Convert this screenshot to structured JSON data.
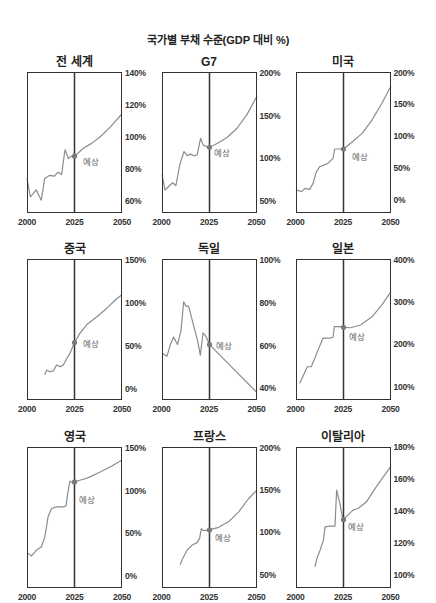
{
  "page": {
    "title": "국가별 부채 수준(GDP 대비 %)"
  },
  "chart_data": {
    "type": "line",
    "title": "국가별 부채 수준(GDP 대비 %)",
    "layout": "small-multiples 3x3 (third row cropped)",
    "colors": {
      "line": "#8c8c8c",
      "dot": "#7a7a7a",
      "frame": "#333333",
      "label": "#666666"
    },
    "forecast_start": 2025,
    "panels": [
      {
        "title": "전 세계",
        "xlim": [
          2000,
          2050
        ],
        "ylim": [
          52.5,
          140.6
        ],
        "xticks": [
          {
            "value": 2000,
            "label": "2000"
          },
          {
            "value": 2025,
            "label": "2025"
          },
          {
            "value": 2050,
            "label": "2050"
          }
        ],
        "yticks": [
          {
            "value": 140,
            "label": "140%"
          },
          {
            "value": 120,
            "label": "120%"
          },
          {
            "value": 100,
            "label": "100%"
          },
          {
            "value": 80,
            "label": "80%"
          },
          {
            "value": 60,
            "label": "60%"
          }
        ],
        "history": [
          [
            2000,
            74
          ],
          [
            2001.8,
            62.5
          ],
          [
            2004.8,
            67
          ],
          [
            2007.5,
            60.5
          ],
          [
            2009.3,
            74
          ],
          [
            2011.8,
            76
          ],
          [
            2014.5,
            75.5
          ],
          [
            2016.3,
            78
          ],
          [
            2018.2,
            76.5
          ],
          [
            2020,
            92
          ],
          [
            2021.8,
            86.5
          ],
          [
            2023.2,
            88
          ],
          [
            2025,
            88
          ]
        ],
        "forecast": [
          [
            2025,
            88
          ],
          [
            2029.7,
            93
          ],
          [
            2034,
            96
          ],
          [
            2038.4,
            100
          ],
          [
            2043.7,
            106
          ],
          [
            2050,
            114.5
          ]
        ],
        "forecast_label": {
          "text": "예상",
          "dx": 8,
          "dy": 6
        }
      },
      {
        "title": "G7",
        "xlim": [
          2000,
          2050
        ],
        "ylim": [
          36,
          201.2
        ],
        "xticks": [
          {
            "value": 2000,
            "label": "2000"
          },
          {
            "value": 2025,
            "label": "2025"
          },
          {
            "value": 2050,
            "label": "2050"
          }
        ],
        "yticks": [
          {
            "value": 200,
            "label": "200%"
          },
          {
            "value": 150,
            "label": "150%"
          },
          {
            "value": 100,
            "label": "100%"
          },
          {
            "value": 50,
            "label": "50%"
          }
        ],
        "history": [
          [
            2000,
            81
          ],
          [
            2001.6,
            63
          ],
          [
            2003.5,
            67
          ],
          [
            2005.6,
            71.5
          ],
          [
            2007.3,
            68
          ],
          [
            2009.5,
            94
          ],
          [
            2011.6,
            108
          ],
          [
            2013.4,
            103
          ],
          [
            2015,
            105
          ],
          [
            2016.8,
            103
          ],
          [
            2018.5,
            104
          ],
          [
            2020.3,
            123.5
          ],
          [
            2021.7,
            115.5
          ],
          [
            2023.3,
            114
          ],
          [
            2025,
            113
          ]
        ],
        "forecast": [
          [
            2025,
            113
          ],
          [
            2029,
            117.5
          ],
          [
            2034.2,
            124.5
          ],
          [
            2039.4,
            135
          ],
          [
            2044.6,
            151
          ],
          [
            2050,
            173
          ]
        ],
        "forecast_label": {
          "text": "예상",
          "dx": 5,
          "dy": 6
        }
      },
      {
        "title": "미국",
        "xlim": [
          2000,
          2050
        ],
        "ylim": [
          -20.6,
          201
        ],
        "xticks": [
          {
            "value": 2000,
            "label": "2000"
          },
          {
            "value": 2025,
            "label": "2025"
          },
          {
            "value": 2050,
            "label": "2050"
          }
        ],
        "yticks": [
          {
            "value": 200,
            "label": "200%"
          },
          {
            "value": 150,
            "label": "150%"
          },
          {
            "value": 100,
            "label": "100%"
          },
          {
            "value": 50,
            "label": "50%"
          },
          {
            "value": 0,
            "label": "0%"
          }
        ],
        "history": [
          [
            2000,
            15.5
          ],
          [
            2003,
            13
          ],
          [
            2004.7,
            18
          ],
          [
            2007.2,
            16.5
          ],
          [
            2009,
            26
          ],
          [
            2010.7,
            44
          ],
          [
            2012.4,
            52
          ],
          [
            2015,
            55
          ],
          [
            2016.8,
            57.5
          ],
          [
            2018.5,
            62.5
          ],
          [
            2019.5,
            65
          ],
          [
            2020.3,
            80
          ],
          [
            2022,
            80
          ],
          [
            2025,
            80
          ]
        ],
        "forecast": [
          [
            2025,
            80
          ],
          [
            2029.7,
            91.5
          ],
          [
            2034.8,
            104.5
          ],
          [
            2040,
            125.5
          ],
          [
            2045.2,
            152
          ],
          [
            2050,
            179
          ]
        ],
        "forecast_label": {
          "text": "예상",
          "dx": 8.5,
          "dy": 8
        }
      },
      {
        "title": "중국",
        "xlim": [
          2000,
          2050
        ],
        "ylim": [
          -12.8,
          151.2
        ],
        "xticks": [
          {
            "value": 2000,
            "label": "2000"
          },
          {
            "value": 2025,
            "label": "2025"
          },
          {
            "value": 2050,
            "label": "2050"
          }
        ],
        "yticks": [
          {
            "value": 150,
            "label": "150%"
          },
          {
            "value": 100,
            "label": "100%"
          },
          {
            "value": 50,
            "label": "50%"
          },
          {
            "value": 0,
            "label": "0%"
          }
        ],
        "history": [
          [
            2009.4,
            16.5
          ],
          [
            2010.3,
            22
          ],
          [
            2012,
            20
          ],
          [
            2013.8,
            21
          ],
          [
            2015.6,
            28
          ],
          [
            2017.5,
            26
          ],
          [
            2019.1,
            28
          ],
          [
            2020.9,
            35.5
          ],
          [
            2022.6,
            41.5
          ],
          [
            2025,
            54
          ]
        ],
        "forecast": [
          [
            2025,
            54
          ],
          [
            2027.9,
            65
          ],
          [
            2031.5,
            75
          ],
          [
            2036.8,
            84
          ],
          [
            2042,
            94
          ],
          [
            2046.5,
            103.5
          ],
          [
            2050,
            110
          ]
        ],
        "forecast_label": {
          "text": "예상",
          "dx": 8,
          "dy": 1
        }
      },
      {
        "title": "독일",
        "xlim": [
          2000,
          2050
        ],
        "ylim": [
          34.6,
          100.5
        ],
        "xticks": [
          {
            "value": 2000,
            "label": "2000"
          },
          {
            "value": 2025,
            "label": "2025"
          },
          {
            "value": 2050,
            "label": "2050"
          }
        ],
        "yticks": [
          {
            "value": 100,
            "label": "100%"
          },
          {
            "value": 80,
            "label": "80%"
          },
          {
            "value": 60,
            "label": "60%"
          },
          {
            "value": 40,
            "label": "40%"
          }
        ],
        "history": [
          [
            2000,
            56.5
          ],
          [
            2002.6,
            55
          ],
          [
            2004.4,
            60.5
          ],
          [
            2006.1,
            64
          ],
          [
            2008.2,
            60.5
          ],
          [
            2010,
            67
          ],
          [
            2011.4,
            80.5
          ],
          [
            2012.5,
            78.5
          ],
          [
            2014,
            78.5
          ],
          [
            2016.6,
            69.5
          ],
          [
            2018.7,
            62.5
          ],
          [
            2020.2,
            55.5
          ],
          [
            2021.6,
            66
          ],
          [
            2023,
            64.5
          ],
          [
            2025,
            60.5
          ]
        ],
        "forecast": [
          [
            2025,
            60.5
          ],
          [
            2050,
            38
          ]
        ],
        "forecast_label": {
          "text": "예상",
          "dx": 7,
          "dy": 1
        }
      },
      {
        "title": "일본",
        "xlim": [
          2000,
          2050
        ],
        "ylim": [
          68.2,
          402.4
        ],
        "xticks": [
          {
            "value": 2000,
            "label": "2000"
          },
          {
            "value": 2025,
            "label": "2025"
          },
          {
            "value": 2050,
            "label": "2050"
          }
        ],
        "yticks": [
          {
            "value": 400,
            "label": "400%"
          },
          {
            "value": 300,
            "label": "300%"
          },
          {
            "value": 200,
            "label": "200%"
          },
          {
            "value": 100,
            "label": "100%"
          }
        ],
        "history": [
          [
            2002,
            108
          ],
          [
            2004,
            128
          ],
          [
            2006,
            147
          ],
          [
            2008,
            147
          ],
          [
            2009.9,
            167
          ],
          [
            2011.6,
            187
          ],
          [
            2014.2,
            214.5
          ],
          [
            2016,
            215
          ],
          [
            2018,
            215
          ],
          [
            2019.5,
            217
          ],
          [
            2020.2,
            242
          ],
          [
            2022.8,
            242
          ],
          [
            2025,
            240.5
          ]
        ],
        "forecast": [
          [
            2025,
            240.5
          ],
          [
            2028.8,
            239.5
          ],
          [
            2034,
            246
          ],
          [
            2040,
            265.5
          ],
          [
            2045.2,
            293.5
          ],
          [
            2050,
            325
          ]
        ],
        "forecast_label": {
          "text": "예상",
          "dx": 5.5,
          "dy": 9.5
        }
      },
      {
        "title": "영국",
        "xlim": [
          2000,
          2050
        ],
        "ylim": [
          -13.6,
          150.7
        ],
        "xticks": [
          {
            "value": 2000,
            "label": "2000"
          },
          {
            "value": 2025,
            "label": "2025"
          },
          {
            "value": 2050,
            "label": "2050"
          }
        ],
        "yticks": [
          {
            "value": 150,
            "label": "150%"
          },
          {
            "value": 100,
            "label": "100%"
          },
          {
            "value": 50,
            "label": "50%"
          },
          {
            "value": 0,
            "label": "0%"
          }
        ],
        "history": [
          [
            2000.5,
            27
          ],
          [
            2002.3,
            23.5
          ],
          [
            2005,
            30.5
          ],
          [
            2007.6,
            34.5
          ],
          [
            2009.4,
            46
          ],
          [
            2011.1,
            69.5
          ],
          [
            2012.9,
            79
          ],
          [
            2015.6,
            81
          ],
          [
            2019.1,
            81
          ],
          [
            2020.5,
            82
          ],
          [
            2021.7,
            100.5
          ],
          [
            2022.6,
            111
          ],
          [
            2024,
            109
          ],
          [
            2025,
            110
          ]
        ],
        "forecast": [
          [
            2025,
            110
          ],
          [
            2027.9,
            112
          ],
          [
            2032.3,
            115
          ],
          [
            2038.5,
            121.5
          ],
          [
            2044.7,
            128.5
          ],
          [
            2050,
            135.5
          ]
        ],
        "forecast_label": {
          "text": "예상",
          "dx": 4,
          "dy": 18
        }
      },
      {
        "title": "프랑스",
        "xlim": [
          2000,
          2050
        ],
        "ylim": [
          34.5,
          200.7
        ],
        "xticks": [
          {
            "value": 2000,
            "label": "2000"
          },
          {
            "value": 2025,
            "label": "2025"
          },
          {
            "value": 2050,
            "label": "2050"
          }
        ],
        "yticks": [
          {
            "value": 200,
            "label": "200%"
          },
          {
            "value": 150,
            "label": "150%"
          },
          {
            "value": 100,
            "label": "100%"
          },
          {
            "value": 50,
            "label": "50%"
          }
        ],
        "history": [
          [
            2009.6,
            62
          ],
          [
            2010.5,
            67.5
          ],
          [
            2013.2,
            79
          ],
          [
            2015.8,
            85
          ],
          [
            2018.4,
            88
          ],
          [
            2019.8,
            93
          ],
          [
            2020.7,
            104.5
          ],
          [
            2021.6,
            102.5
          ],
          [
            2023,
            102.5
          ],
          [
            2025,
            103
          ]
        ],
        "forecast": [
          [
            2025,
            103
          ],
          [
            2029.8,
            106
          ],
          [
            2035,
            112.5
          ],
          [
            2040.3,
            124
          ],
          [
            2045.6,
            140
          ],
          [
            2050,
            150
          ]
        ],
        "forecast_label": {
          "text": "예상",
          "dx": 6,
          "dy": 8
        }
      },
      {
        "title": "이탈리아",
        "xlim": [
          2000,
          2050
        ],
        "ylim": [
          91.7,
          180
        ],
        "xticks": [
          {
            "value": 2000,
            "label": "2000"
          },
          {
            "value": 2025,
            "label": "2025"
          },
          {
            "value": 2050,
            "label": "2050"
          }
        ],
        "yticks": [
          {
            "value": 180,
            "label": "180%"
          },
          {
            "value": 160,
            "label": "160%"
          },
          {
            "value": 140,
            "label": "140%"
          },
          {
            "value": 120,
            "label": "120%"
          },
          {
            "value": 100,
            "label": "100%"
          }
        ],
        "history": [
          [
            2010,
            105
          ],
          [
            2010.9,
            110
          ],
          [
            2012.7,
            115.5
          ],
          [
            2014.4,
            121.5
          ],
          [
            2015.3,
            130
          ],
          [
            2017.9,
            130.5
          ],
          [
            2020.5,
            130.5
          ],
          [
            2021.4,
            153
          ],
          [
            2023.1,
            144.5
          ],
          [
            2024.5,
            135.5
          ],
          [
            2025,
            134.5
          ]
        ],
        "forecast": [
          [
            2025,
            134.5
          ],
          [
            2027.4,
            137.5
          ],
          [
            2030,
            140.5
          ],
          [
            2032.6,
            141.5
          ],
          [
            2037,
            145.5
          ],
          [
            2042.2,
            155
          ],
          [
            2050,
            168
          ]
        ],
        "forecast_label": {
          "text": "예상",
          "dx": 5,
          "dy": 7
        }
      }
    ]
  }
}
